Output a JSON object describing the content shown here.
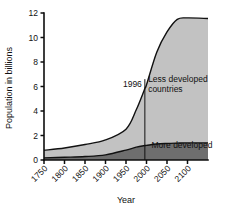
{
  "chart_data": {
    "type": "area",
    "title": "",
    "xlabel": "Year",
    "ylabel": "Population in billions",
    "xlim": [
      1750,
      2150
    ],
    "ylim": [
      0,
      12
    ],
    "xticks": [
      1750,
      1800,
      1850,
      1900,
      1950,
      2000,
      2050,
      2100
    ],
    "xtick_labels": [
      "1750",
      "1800",
      "1850",
      "1900",
      "1950",
      "2000",
      "2050",
      "2100"
    ],
    "yticks": [
      0,
      2,
      4,
      6,
      8,
      10,
      12
    ],
    "ytick_labels": [
      "0",
      "2",
      "4",
      "6",
      "8",
      "10",
      "12"
    ],
    "grid": false,
    "legend_position": "inline-annotations",
    "stacked": true,
    "x": [
      1750,
      1800,
      1850,
      1900,
      1950,
      1975,
      1996,
      2000,
      2025,
      2050,
      2075,
      2100,
      2150
    ],
    "series": [
      {
        "name": "More developed",
        "label": "More developed",
        "color": "#6e6e6e",
        "values": [
          0.17,
          0.22,
          0.28,
          0.42,
          0.81,
          1.05,
          1.18,
          1.19,
          1.3,
          1.35,
          1.38,
          1.4,
          1.4
        ]
      },
      {
        "name": "Less developed countries",
        "label": "Less developed countries",
        "color": "#c2c2c2",
        "values": [
          0.62,
          0.76,
          0.98,
          1.22,
          1.71,
          3.05,
          4.65,
          4.95,
          7.5,
          9.1,
          10.1,
          10.2,
          10.15
        ]
      }
    ],
    "totals": [
      0.79,
      0.98,
      1.26,
      1.64,
      2.52,
      4.1,
      5.83,
      6.14,
      8.8,
      10.45,
      11.48,
      11.6,
      11.55
    ],
    "annotations": [
      {
        "name": "year-marker-1996",
        "text": "1996",
        "x": 1996,
        "y_top": 6.6,
        "y_bottom": 0,
        "has_rule": true
      },
      {
        "name": "less-developed-label",
        "text_line1": "Less developed",
        "text_line2": "countries",
        "x": 2004,
        "y": 6.4
      },
      {
        "name": "more-developed-label",
        "text": "More developed",
        "x": 2012,
        "y": 1.0
      }
    ]
  },
  "colors": {
    "less_developed_fill": "#c2c2c2",
    "more_developed_fill": "#6e6e6e",
    "axis": "#0d0d0d",
    "text": "#111111",
    "background": "#ffffff"
  }
}
